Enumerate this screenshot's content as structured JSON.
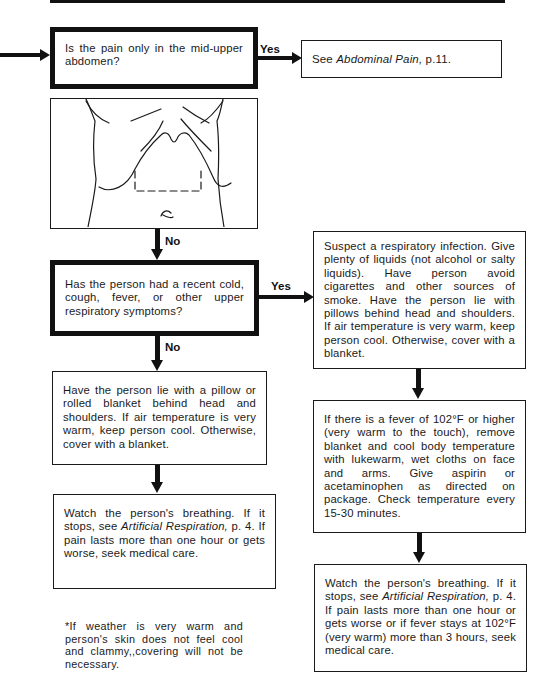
{
  "flowchart": {
    "question_1": {
      "text": "Is the pain only in the mid-upper abdomen?",
      "yes_label": "Yes",
      "yes_result": {
        "prefix": "See ",
        "italic": "Abdominal Pain,",
        "suffix": " p.11."
      }
    },
    "illustration": {
      "icon": "abdomen-outline-icon",
      "description": "Torso outline with dashed box marking mid-upper abdomen"
    },
    "no_label_1": "No",
    "question_2": {
      "text": "Has the person had a recent cold, cough, fever, or other upper respiratory symptoms?",
      "yes_label": "Yes",
      "no_label": "No"
    },
    "yes_branch": {
      "box_1": "Suspect a respiratory infection. Give plenty of liquids (not alcohol or salty liquids). Have person avoid cigarettes and other sources of smoke. Have the person lie with pillows behind head and shoulders. If air temperature is very warm, keep person cool. Otherwise, cover with a blanket.",
      "box_2": "If there is a fever of 102°F or higher (very warm to the touch), remove blanket and cool body temperature with lukewarm, wet cloths on face and arms. Give aspirin or acetaminophen as directed on package. Check temperature every 15-30 minutes.",
      "box_3": {
        "prefix": "Watch the person's breathing. If it stops, see ",
        "italic": "Artificial Respiration,",
        "suffix": " p. 4. If pain lasts more than one hour or gets worse or if fever stays at 102°F (very warm) more than 3 hours, seek medical care."
      }
    },
    "no_branch": {
      "box_1": "Have the person lie with a pillow or rolled blanket behind head and shoulders. If air temperature is very warm, keep person cool. Otherwise, cover with a blanket.",
      "box_2": {
        "prefix": "Watch the person's breathing. If it stops, see ",
        "italic": "Artificial Respiration,",
        "suffix": " p. 4. If pain lasts more than one hour or gets worse, seek medical care."
      }
    },
    "footnote": "*If weather is very warm and person's skin does not feel cool and clammy,,covering will not be necessary."
  }
}
